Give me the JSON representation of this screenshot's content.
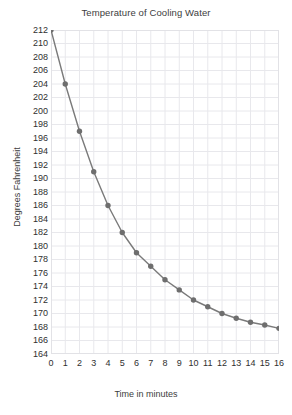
{
  "chart_data": {
    "type": "line",
    "title": "Temperature of Cooling Water",
    "xlabel": "Time in minutes",
    "ylabel": "Degrees Fahrenheit",
    "x": [
      0,
      1,
      2,
      3,
      4,
      5,
      6,
      7,
      8,
      9,
      10,
      11,
      12,
      13,
      14,
      15,
      16
    ],
    "values": [
      212,
      204,
      197,
      191,
      186,
      182,
      179,
      177,
      175,
      173.5,
      172,
      171,
      170,
      169.3,
      168.7,
      168.3,
      167.8
    ],
    "series": [
      {
        "name": "Temperature",
        "values": [
          212,
          204,
          197,
          191,
          186,
          182,
          179,
          177,
          175,
          173.5,
          172,
          171,
          170,
          169.3,
          168.7,
          168.3,
          167.8
        ]
      }
    ],
    "xlim": [
      0,
      16
    ],
    "ylim": [
      164,
      212
    ],
    "xticks": [
      0,
      1,
      2,
      3,
      4,
      5,
      6,
      7,
      8,
      9,
      10,
      11,
      12,
      13,
      14,
      15,
      16
    ],
    "xtick_labels": [
      "0",
      "1",
      "2",
      "3",
      "4",
      "5",
      "6",
      "7",
      "8",
      "9",
      "10",
      "11",
      "12",
      "13",
      "14",
      "15",
      "16"
    ],
    "yticks": [
      164,
      166,
      168,
      170,
      172,
      174,
      176,
      178,
      180,
      182,
      184,
      186,
      188,
      190,
      192,
      194,
      196,
      198,
      200,
      202,
      204,
      206,
      208,
      210,
      212
    ],
    "ytick_labels": [
      "164",
      "166",
      "168",
      "170",
      "172",
      "174",
      "176",
      "178",
      "180",
      "182",
      "184",
      "186",
      "188",
      "190",
      "192",
      "194",
      "196",
      "198",
      "200",
      "202",
      "204",
      "206",
      "208",
      "210",
      "212"
    ],
    "grid": true,
    "legend": null,
    "legend_position": "none",
    "marker": "circle",
    "colors": {
      "line": "#7a7a7a",
      "marker": "#6e6e6e",
      "grid": "#e8e8ec",
      "axis_border": "#e0e0e4",
      "background": "#ffffff",
      "text": "#3a3a3a"
    }
  }
}
